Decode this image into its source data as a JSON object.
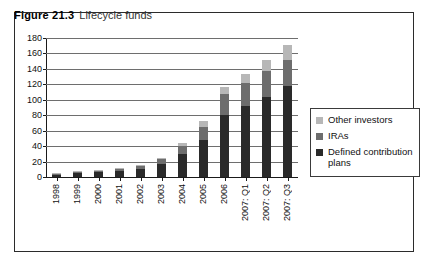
{
  "figure": {
    "number": "Figure 21.3",
    "title": "Lifecycle funds"
  },
  "legend": {
    "items": [
      {
        "label": "Other investors",
        "color": "#b7b7b7",
        "swatch": "legend-swatch-other-investors"
      },
      {
        "label": "IRAs",
        "color": "#6d6d6d",
        "swatch": "legend-swatch-iras"
      },
      {
        "label": "Defined contribution plans",
        "color": "#2a2a2a",
        "swatch": "legend-swatch-defined-contribution-plans"
      }
    ]
  },
  "chart_data": {
    "type": "bar",
    "stacked": true,
    "title": "Lifecycle funds",
    "xlabel": "",
    "ylabel": "",
    "ylim": [
      0,
      180
    ],
    "ytick_step": 20,
    "yticks": [
      0,
      20,
      40,
      60,
      80,
      100,
      120,
      140,
      160,
      180
    ],
    "grid": true,
    "grid_axis": "y",
    "legend_position": "right",
    "categories": [
      "1998",
      "1999",
      "2000",
      "2001",
      "2002",
      "2003",
      "2004",
      "2005",
      "2006",
      "2007: Q1",
      "2007: Q2",
      "2007: Q3"
    ],
    "series": [
      {
        "name": "Defined contribution plans",
        "color": "#2a2a2a",
        "values": [
          3,
          5,
          6,
          8,
          10,
          17,
          30,
          48,
          80,
          92,
          104,
          118
        ]
      },
      {
        "name": "IRAs",
        "color": "#6d6d6d",
        "values": [
          1,
          2,
          2,
          3,
          4,
          6,
          10,
          17,
          27,
          30,
          33,
          34
        ]
      },
      {
        "name": "Other investors",
        "color": "#b7b7b7",
        "values": [
          1,
          1,
          1,
          1,
          1,
          2,
          4,
          7,
          9,
          11,
          14,
          19
        ]
      }
    ],
    "totals": [
      5,
      8,
      9,
      12,
      15,
      25,
      44,
      72,
      116,
      133,
      151,
      171
    ]
  }
}
